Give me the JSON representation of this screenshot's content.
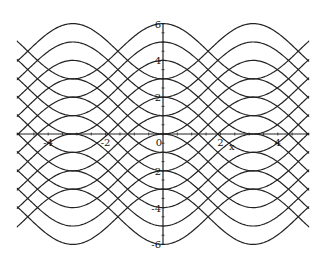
{
  "chart_data": {
    "type": "line",
    "title": "",
    "xlabel": "x",
    "ylabel": "",
    "xlim": [
      -5.1,
      5.1
    ],
    "ylim": [
      -6,
      6
    ],
    "grid": false,
    "legend": null,
    "x_ticks": [
      -4,
      -2,
      0,
      2,
      4
    ],
    "x_tick_labels": [
      "-4",
      "-2",
      "0",
      "2",
      "4"
    ],
    "y_ticks": [
      -6,
      -4,
      -2,
      2,
      4,
      6
    ],
    "y_tick_labels": [
      "-6",
      "-4",
      "-2",
      "2",
      "4",
      "6"
    ],
    "series": [
      {
        "name": "k+1.5cos(x)",
        "offsets": [
          -4.5,
          -3.5,
          -2.5,
          -1.5,
          -0.5,
          0.5,
          1.5,
          2.5,
          3.5,
          4.5
        ],
        "amplitude": 1.5
      },
      {
        "name": "k-1.5cos(x)",
        "offsets": [
          -4.5,
          -3.5,
          -2.5,
          -1.5,
          -0.5,
          0.5,
          1.5,
          2.5,
          3.5,
          4.5
        ],
        "amplitude": -1.5
      }
    ],
    "color": "#222222"
  },
  "axes": {
    "x_label": "x"
  }
}
